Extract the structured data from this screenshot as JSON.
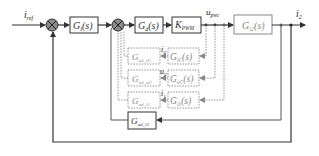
{
  "diagram": {
    "type": "control-block-diagram",
    "signals": {
      "input": {
        "main": "i",
        "sub": "ref"
      },
      "output": {
        "main": "i",
        "sub": "2"
      },
      "u_pwc": {
        "main": "u",
        "sub": "pwc"
      },
      "i_c": {
        "main": "i",
        "sub": "C"
      },
      "u_c": {
        "main": "u",
        "sub": "C"
      },
      "i_1": {
        "main": "i",
        "sub": "1"
      }
    },
    "blocks": {
      "gi": {
        "main": "G",
        "sub": "i",
        "suffix": "(s)"
      },
      "gd": {
        "main": "G",
        "sub": "d",
        "suffix": "(s)"
      },
      "kpwm": {
        "main": "K",
        "sub": "PWM",
        "suffix": ""
      },
      "gi2": {
        "main": "G",
        "sub": "i2",
        "suffix": "(s)"
      },
      "gic": {
        "main": "G",
        "sub": "iC",
        "suffix": "(s)"
      },
      "guc": {
        "main": "G",
        "sub": "uC",
        "suffix": "(s)"
      },
      "gi1": {
        "main": "G",
        "sub": "i1",
        "suffix": "(s)"
      },
      "gad_ic": {
        "main": "G",
        "sub": "ad_iC",
        "suffix": ""
      },
      "gad_uc": {
        "main": "G",
        "sub": "ad_uC",
        "suffix": ""
      },
      "gad_i1": {
        "main": "G",
        "sub": "ad_i1",
        "suffix": ""
      },
      "gad_i2": {
        "main": "G",
        "sub": "ad_i2",
        "suffix": ""
      }
    },
    "colors": {
      "solid": "#333333",
      "dashed": "#888888",
      "junction_fill": "#8a8a8a"
    }
  }
}
